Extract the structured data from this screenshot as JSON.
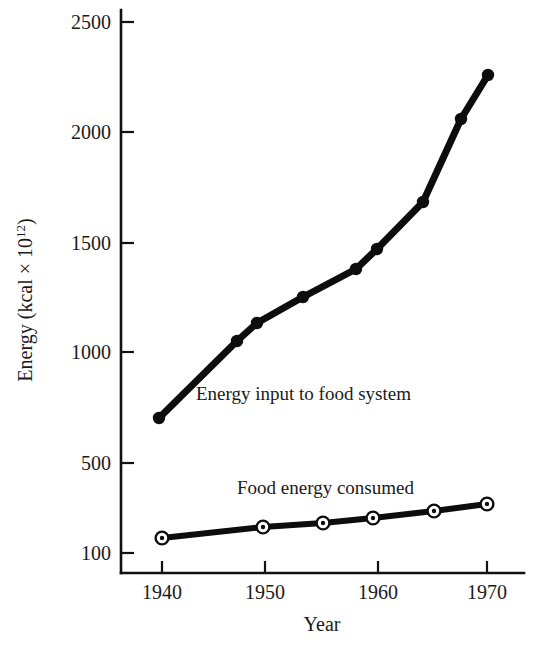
{
  "chart_data": {
    "type": "line",
    "title": "",
    "xlabel": "Year",
    "ylabel": "Energy (kcal × 10",
    "ylabel_exponent": "12",
    "ylabel_suffix": ")",
    "xlim": [
      1938,
      1972
    ],
    "ylim": [
      100,
      2500
    ],
    "grid": false,
    "legend_position": "inline-annotation",
    "y_ticks": [
      {
        "value": 2500,
        "label": "2500",
        "py": 22
      },
      {
        "value": 2000,
        "label": "2000",
        "py": 132
      },
      {
        "value": 1500,
        "label": "1500",
        "py": 243
      },
      {
        "value": 1000,
        "label": "1000",
        "py": 352
      },
      {
        "value": 500,
        "label": "500",
        "py": 463
      },
      {
        "value": 100,
        "label": "100",
        "py": 553
      }
    ],
    "x_ticks": [
      {
        "value": 1940,
        "label": "1940",
        "px": 162
      },
      {
        "value": 1950,
        "label": "1950",
        "px": 265
      },
      {
        "value": 1960,
        "label": "1960",
        "px": 378
      },
      {
        "value": 1970,
        "label": "1970",
        "px": 487
      }
    ],
    "series": [
      {
        "name": "Energy input to food system",
        "annotation": "Energy input to food system",
        "marker": "solid-dot",
        "x": [
          1940,
          1947.5,
          1949.5,
          1954,
          1958,
          1960,
          1964.5,
          1968,
          1970.5
        ],
        "values": [
          700,
          1050,
          1130,
          1255,
          1385,
          1465,
          1675,
          2040,
          2245
        ],
        "points_px": [
          {
            "px": 159,
            "py": 418
          },
          {
            "px": 237,
            "py": 341
          },
          {
            "px": 257,
            "py": 323
          },
          {
            "px": 303,
            "py": 297
          },
          {
            "px": 356,
            "py": 269
          },
          {
            "px": 377,
            "py": 249
          },
          {
            "px": 423,
            "py": 202
          },
          {
            "px": 461,
            "py": 119
          },
          {
            "px": 488,
            "py": 75
          }
        ],
        "annotation_px": {
          "px": 196,
          "py": 400
        }
      },
      {
        "name": "Food energy consumed",
        "annotation": "Food energy consumed",
        "marker": "bullseye",
        "x": [
          1940,
          1950,
          1955.5,
          1960.5,
          1966.5,
          1971
        ],
        "values": [
          130,
          165,
          185,
          205,
          235,
          255
        ],
        "points_px": [
          {
            "px": 162,
            "py": 538
          },
          {
            "px": 263,
            "py": 527
          },
          {
            "px": 323,
            "py": 523
          },
          {
            "px": 373,
            "py": 518
          },
          {
            "px": 434,
            "py": 511
          },
          {
            "px": 487,
            "py": 504
          }
        ],
        "annotation_px": {
          "px": 237,
          "py": 494
        }
      }
    ],
    "axis_geometry": {
      "x_axis_y": 573,
      "y_axis_x": 121,
      "x_axis_left": 121,
      "x_axis_right": 524,
      "y_axis_top": 10,
      "tick_len_x": 12,
      "tick_len_y": 13
    },
    "colors": {
      "ink": "#0d0d0d",
      "axis": "#111111",
      "background": "#ffffff",
      "marker_fill": "#ffffff"
    }
  }
}
